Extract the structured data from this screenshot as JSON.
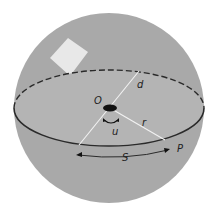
{
  "diagram": {
    "type": "sphere-geometry",
    "colors": {
      "sphere_fill": "#a9a9a9",
      "equator_fill": "#b6b6b6",
      "line": "#2a2a2a",
      "inner_line": "#f0f0f0",
      "highlight": "#e8e8e8",
      "center_dot": "#111111"
    },
    "labels": {
      "center": "O",
      "diameter_segment": "d",
      "radius": "r",
      "angle": "u",
      "arc": "S",
      "point": "P"
    }
  }
}
